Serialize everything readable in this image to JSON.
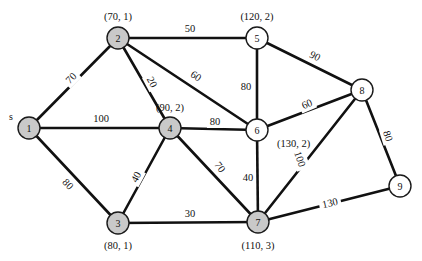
{
  "diagram": {
    "source_marker": "s",
    "colors": {
      "edge": "#111111",
      "node_fill_highlight": "#c9c9c9",
      "node_fill_plain": "#ffffff",
      "node_stroke": "#1a1a1a",
      "background": "#ffffff",
      "text": "#111111"
    },
    "nodes": [
      {
        "id": "1",
        "label": "1",
        "x": 29,
        "y": 128,
        "filled": true,
        "attr": "",
        "attr_x": 0,
        "attr_y": 0,
        "attr_anchor": "middle"
      },
      {
        "id": "2",
        "label": "2",
        "x": 118,
        "y": 38,
        "filled": true,
        "attr": "(70, 1)",
        "attr_x": 118,
        "attr_y": 16,
        "attr_anchor": "middle"
      },
      {
        "id": "3",
        "label": "3",
        "x": 118,
        "y": 223,
        "filled": true,
        "attr": "(80, 1)",
        "attr_x": 118,
        "attr_y": 245,
        "attr_anchor": "middle"
      },
      {
        "id": "4",
        "label": "4",
        "x": 170,
        "y": 128,
        "filled": true,
        "attr": "(90, 2)",
        "attr_x": 170,
        "attr_y": 107,
        "attr_anchor": "middle"
      },
      {
        "id": "5",
        "label": "5",
        "x": 257,
        "y": 38,
        "filled": false,
        "attr": "(120, 2)",
        "attr_x": 257,
        "attr_y": 16,
        "attr_anchor": "middle"
      },
      {
        "id": "6",
        "label": "6",
        "x": 257,
        "y": 130,
        "filled": false,
        "attr": "(130, 2)",
        "attr_x": 277,
        "attr_y": 143,
        "attr_anchor": "start"
      },
      {
        "id": "7",
        "label": "7",
        "x": 258,
        "y": 222,
        "filled": true,
        "attr": "(110, 3)",
        "attr_x": 258,
        "attr_y": 245,
        "attr_anchor": "middle"
      },
      {
        "id": "8",
        "label": "8",
        "x": 362,
        "y": 90,
        "filled": false,
        "attr": "",
        "attr_x": 0,
        "attr_y": 0,
        "attr_anchor": "middle"
      },
      {
        "id": "9",
        "label": "9",
        "x": 400,
        "y": 186,
        "filled": false,
        "attr": "",
        "attr_x": 0,
        "attr_y": 0,
        "attr_anchor": "middle"
      }
    ],
    "node_radius": 11,
    "edges": [
      {
        "from": "1",
        "to": "2",
        "weight": "70",
        "lx": 71,
        "ly": 78,
        "rotate": -45
      },
      {
        "from": "1",
        "to": "4",
        "weight": "100",
        "lx": 101,
        "ly": 118,
        "rotate": 0
      },
      {
        "from": "1",
        "to": "3",
        "weight": "80",
        "lx": 68,
        "ly": 184,
        "rotate": 47
      },
      {
        "from": "2",
        "to": "5",
        "weight": "50",
        "lx": 190,
        "ly": 28,
        "rotate": 0
      },
      {
        "from": "2",
        "to": "4",
        "weight": "20",
        "lx": 152,
        "ly": 82,
        "rotate": 62
      },
      {
        "from": "2",
        "to": "6",
        "weight": "60",
        "lx": 196,
        "ly": 76,
        "rotate": 33
      },
      {
        "from": "3",
        "to": "4",
        "weight": "40",
        "lx": 136,
        "ly": 177,
        "rotate": -62
      },
      {
        "from": "3",
        "to": "7",
        "weight": "30",
        "lx": 190,
        "ly": 213,
        "rotate": 0
      },
      {
        "from": "4",
        "to": "6",
        "weight": "80",
        "lx": 215,
        "ly": 121,
        "rotate": 0
      },
      {
        "from": "4",
        "to": "7",
        "weight": "70",
        "lx": 220,
        "ly": 167,
        "rotate": 55
      },
      {
        "from": "5",
        "to": "6",
        "weight": "80",
        "lx": 246,
        "ly": 86,
        "rotate": 0
      },
      {
        "from": "5",
        "to": "8",
        "weight": "90",
        "lx": 315,
        "ly": 56,
        "rotate": 27
      },
      {
        "from": "6",
        "to": "8",
        "weight": "60",
        "lx": 307,
        "ly": 104,
        "rotate": -23
      },
      {
        "from": "6",
        "to": "7",
        "weight": "40",
        "lx": 248,
        "ly": 177,
        "rotate": 0
      },
      {
        "from": "7",
        "to": "8",
        "weight": "100",
        "lx": 300,
        "ly": 159,
        "rotate": 70
      },
      {
        "from": "7",
        "to": "9",
        "weight": "130",
        "lx": 330,
        "ly": 203,
        "rotate": -13
      },
      {
        "from": "8",
        "to": "9",
        "weight": "80",
        "lx": 388,
        "ly": 136,
        "rotate": 73
      }
    ]
  }
}
